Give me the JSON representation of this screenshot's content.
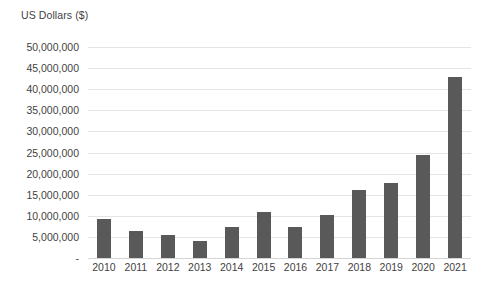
{
  "chart_data": {
    "type": "bar",
    "title": "",
    "subtitle": "",
    "xlabel": "",
    "ylabel": "US Dollars ($)",
    "categories": [
      "2010",
      "2011",
      "2012",
      "2013",
      "2014",
      "2015",
      "2016",
      "2017",
      "2018",
      "2019",
      "2020",
      "2021"
    ],
    "values": [
      9200000,
      6400000,
      5400000,
      4100000,
      7300000,
      11000000,
      7300000,
      10200000,
      16000000,
      17800000,
      24400000,
      43000000
    ],
    "series": [
      {
        "name": "US Dollars ($)",
        "values": [
          9200000,
          6400000,
          5400000,
          4100000,
          7300000,
          11000000,
          7300000,
          10200000,
          16000000,
          17800000,
          24400000,
          43000000
        ]
      }
    ],
    "ylim": [
      0,
      50000000
    ],
    "ytick_values": [
      0,
      5000000,
      10000000,
      15000000,
      20000000,
      25000000,
      30000000,
      35000000,
      40000000,
      45000000,
      50000000
    ],
    "ytick_labels": [
      "-",
      "5,000,000",
      "10,000,000",
      "15,000,000",
      "20,000,000",
      "25,000,000",
      "30,000,000",
      "35,000,000",
      "40,000,000",
      "45,000,000",
      "50,000,000"
    ],
    "grid": true,
    "legend": false,
    "legend_position": "none",
    "bar_color": "#595959",
    "gridline_color": "#e4e4e4",
    "text_color": "#3f3f3f",
    "background_color": "#ffffff"
  }
}
